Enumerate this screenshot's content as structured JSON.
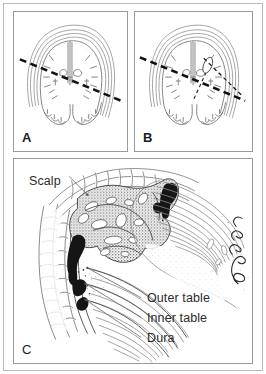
{
  "figure": {
    "background_color": "#ffffff",
    "frame_color": "#b9b9b9",
    "ink_color": "#2b2b2b"
  },
  "panels": [
    {
      "id": "A",
      "letter": "A",
      "caption": "",
      "content_type": "coronal-brain-section",
      "annotations": {
        "dashed_lines": 1,
        "lesion_shown": false
      }
    },
    {
      "id": "B",
      "letter": "B",
      "caption": "",
      "content_type": "coronal-brain-section",
      "annotations": {
        "dashed_lines": 2,
        "lesion_shown": true
      }
    },
    {
      "id": "C",
      "letter": "C",
      "caption": "",
      "content_type": "scalp-skull-dura-detail",
      "annotations": {
        "dashed_lines": 0,
        "lesion_shown": true
      }
    }
  ],
  "callouts": {
    "scalp": "Scalp",
    "outer_table": "Outer table",
    "inner_table": "Inner table",
    "dura": "Dura"
  },
  "signature": {
    "present": true,
    "orientation": "vertical",
    "text": ""
  }
}
